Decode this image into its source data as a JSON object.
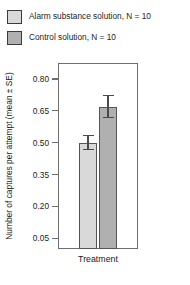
{
  "chart_data": {
    "type": "bar",
    "title": "",
    "xlabel": "Treatment",
    "ylabel": "Number of captures per attempt (mean ± SE)",
    "categories": [
      "Treatment"
    ],
    "ylim": [
      0.0,
      0.875
    ],
    "yticks": [
      0.05,
      0.2,
      0.35,
      0.5,
      0.65,
      0.8
    ],
    "ytick_labels": [
      "0.05",
      "0.20",
      "0.35",
      "0.50",
      "0.65",
      "0.80"
    ],
    "grid": false,
    "legend_position": "above-plot",
    "series": [
      {
        "name": "Alarm substance solution, N = 10",
        "values": [
          0.5
        ],
        "errors": [
          0.035
        ],
        "color": "#d9d9d9"
      },
      {
        "name": "Control solution, N = 10",
        "values": [
          0.67
        ],
        "errors": [
          0.055
        ],
        "color": "#b0b0b0"
      }
    ]
  },
  "legend": {
    "items": [
      {
        "label": "Alarm substance solution, N = 10",
        "color": "#d9d9d9"
      },
      {
        "label": "Control solution, N = 10",
        "color": "#b0b0b0"
      }
    ]
  },
  "axes": {
    "y_title": "Number of captures per attempt (mean ± SE)",
    "x_title": "Treatment"
  }
}
